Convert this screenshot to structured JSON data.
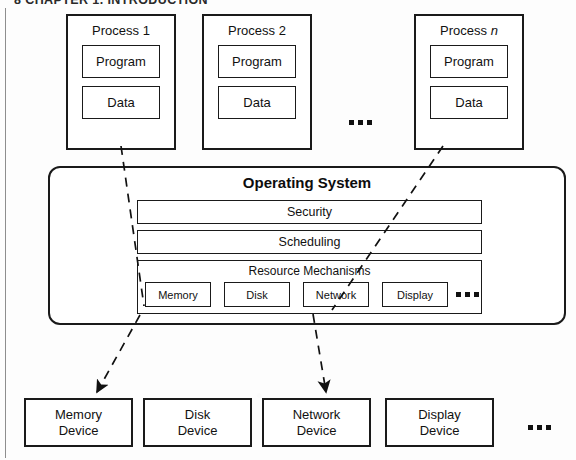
{
  "page": {
    "header_text": "8   CHAPTER 1. INTRODUCTION",
    "width": 576,
    "height": 460
  },
  "colors": {
    "stroke": "#1a1a1a",
    "fill": "#ffffff",
    "background": "#fdfdfd",
    "text": "#111111",
    "rule": "#8e8e8e"
  },
  "diagram": {
    "processes": [
      {
        "title": "Process 1",
        "title_italic_suffix": "",
        "program_label": "Program",
        "data_label": "Data"
      },
      {
        "title": "Process 2",
        "title_italic_suffix": "",
        "program_label": "Program",
        "data_label": "Data"
      },
      {
        "title": "Process ",
        "title_italic_suffix": "n",
        "program_label": "Program",
        "data_label": "Data"
      }
    ],
    "process_row_ellipsis": "...",
    "operating_system": {
      "title": "Operating System",
      "bands": [
        {
          "label": "Security"
        },
        {
          "label": "Scheduling"
        }
      ],
      "resource_band": {
        "label": "Resource Mechanisms",
        "items": [
          {
            "label": "Memory"
          },
          {
            "label": "Disk"
          },
          {
            "label": "Network"
          },
          {
            "label": "Display"
          }
        ],
        "ellipsis": "..."
      }
    },
    "devices": [
      {
        "line1": "Memory",
        "line2": "Device"
      },
      {
        "line1": "Disk",
        "line2": "Device"
      },
      {
        "line1": "Network",
        "line2": "Device"
      },
      {
        "line1": "Display",
        "line2": "Device"
      }
    ],
    "device_row_ellipsis": "...",
    "arrows": [
      {
        "name": "process1-data-to-memory-mechanism",
        "from": "Process 1 Data",
        "to": "Memory resource mechanism",
        "style": "dashed"
      },
      {
        "name": "memory-mechanism-to-memory-device",
        "from": "Memory resource mechanism",
        "to": "Memory Device",
        "style": "dashed",
        "arrowhead": true
      },
      {
        "name": "processn-data-to-network-mechanism",
        "from": "Process n Data",
        "to": "Network resource mechanism",
        "style": "dashed"
      },
      {
        "name": "network-mechanism-to-network-device",
        "from": "Network resource mechanism",
        "to": "Network Device",
        "style": "dashed",
        "arrowhead": true
      }
    ]
  }
}
